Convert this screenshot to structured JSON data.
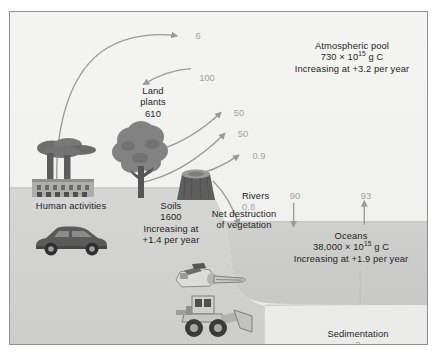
{
  "figure": {
    "units_note": "Pools in 10^15 g C; fluxes in 10^15 g C per year"
  },
  "colors": {
    "frame_border": "#8e8e8e",
    "sky": "#f2f2f0",
    "land": "#d3d3d1",
    "ocean_water": "#cfcfcd",
    "seafloor": "#ededeb",
    "arrow": "#9a9a9a",
    "text": "#1f1f1f",
    "flux_text": "#a2a2a2"
  },
  "pools": {
    "atmosphere": {
      "name": "Atmospheric pool",
      "amount_prefix": "730 × 10",
      "amount_exponent": "15",
      "amount_suffix": " g C",
      "trend": "Increasing at +3.2 per year"
    },
    "land_plants": {
      "name_line1": "Land",
      "name_line2": "plants",
      "amount": "610"
    },
    "soils": {
      "name": "Soils",
      "amount": "1600",
      "trend_line1": "Increasing at",
      "trend_line2": "+1.4 per year"
    },
    "oceans": {
      "name": "Oceans",
      "amount_prefix": "38,000 × 10",
      "amount_exponent": "15",
      "amount_suffix": " g C",
      "trend": "Increasing at +1.9 per year"
    }
  },
  "processes": {
    "human_activities": "Human activities",
    "net_destruction_line1": "Net destruction",
    "net_destruction_line2": "of vegetation",
    "rivers_name": "Rivers",
    "rivers_value": "0.8",
    "sedimentation_name": "Sedimentation",
    "sedimentation_value": "3"
  },
  "fluxes": {
    "fossil_fuel_emission": "6",
    "photosynthesis": "100",
    "respiration_upper": "50",
    "respiration_lower": "50",
    "land_use_change": "0.9",
    "ocean_uptake": "90",
    "ocean_release": "93"
  },
  "icons": {
    "factory": "factory-icon",
    "tree": "tree-icon",
    "stump": "tree-stump-icon",
    "car": "car-icon",
    "chainsaw": "chainsaw-icon",
    "loader": "wheel-loader-icon"
  }
}
